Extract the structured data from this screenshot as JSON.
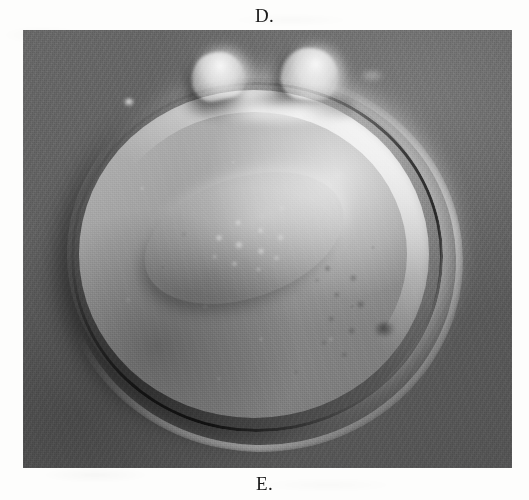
{
  "figure": {
    "panel_label_top": "D.",
    "panel_label_bottom": "E.",
    "micrograph": {
      "alt": "Differential interference contrast micrograph of an oocyte showing two polar bodies and a central pronucleus",
      "background_color": "#5d5d5d",
      "cell_color": "#9b9b9b",
      "highlight_color": "#ffffff",
      "shadow_color": "#1a1a1a"
    },
    "page_color": "#fdfdfc",
    "label_color": "#1b1b1b"
  }
}
